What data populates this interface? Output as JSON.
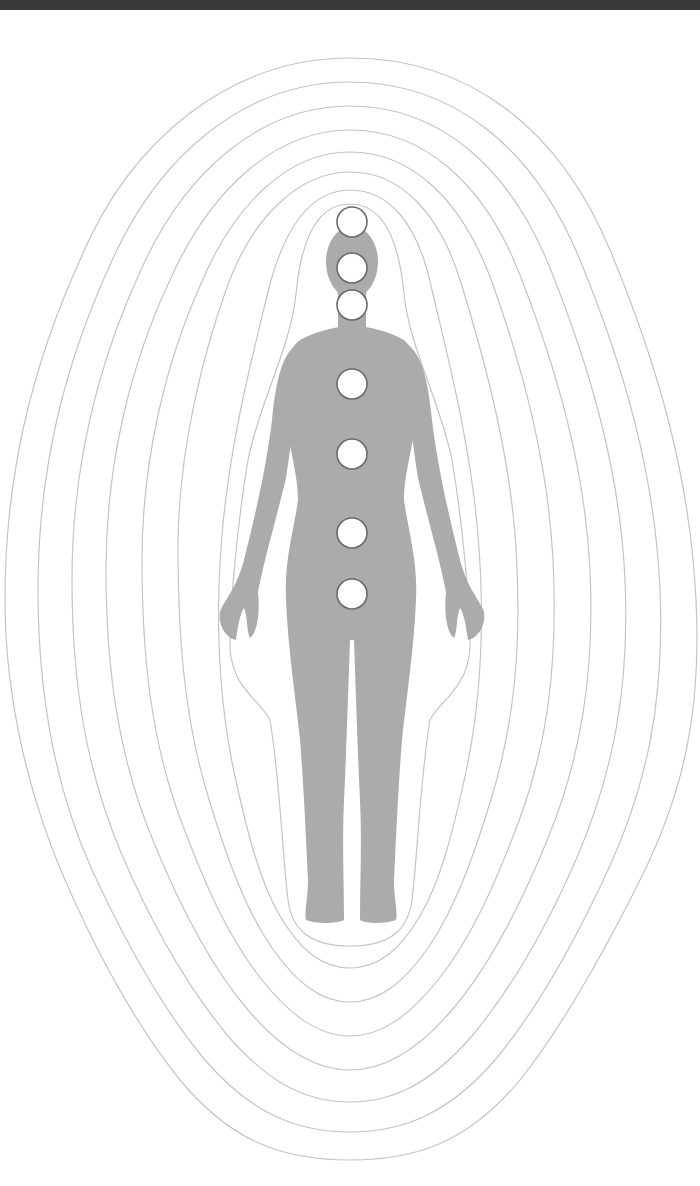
{
  "diagram": {
    "colors": {
      "top_bar": "#3a3a3a",
      "background": "#ffffff",
      "silhouette": "#ababab",
      "aura_lines": "#c4c4c4",
      "chakra_fill": "#ffffff",
      "chakra_stroke": "#6a6a6a"
    },
    "aura_layers": 8,
    "chakras": [
      {
        "name": "crown",
        "cx": 352,
        "cy": 222,
        "r": 15
      },
      {
        "name": "third-eye",
        "cx": 352,
        "cy": 268,
        "r": 15
      },
      {
        "name": "throat",
        "cx": 352,
        "cy": 305,
        "r": 15
      },
      {
        "name": "heart",
        "cx": 352,
        "cy": 384,
        "r": 15
      },
      {
        "name": "solar-plexus",
        "cx": 352,
        "cy": 454,
        "r": 15
      },
      {
        "name": "sacral",
        "cx": 352,
        "cy": 533,
        "r": 15
      },
      {
        "name": "root",
        "cx": 352,
        "cy": 594,
        "r": 15
      }
    ]
  }
}
